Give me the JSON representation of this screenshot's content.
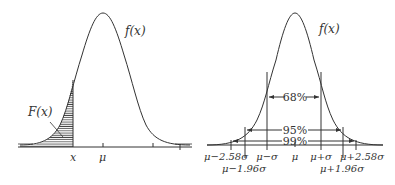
{
  "left_panel": {
    "curve_label": "f(x)",
    "area_label": "F(x)",
    "axis_labels": {
      "x": "x",
      "mu": "μ"
    }
  },
  "right_panel": {
    "curve_label": "f(x)",
    "intervals": [
      {
        "label": "68%",
        "range": "μ±σ"
      },
      {
        "label": "95%",
        "range": "μ±1.96σ"
      },
      {
        "label": "99%",
        "range": "μ±2.58σ"
      }
    ],
    "tick_labels_upper": [
      "μ−2.58σ",
      "μ−σ",
      "μ",
      "μ+σ",
      "μ+2.58σ"
    ],
    "tick_labels_lower": [
      "μ−1.96σ",
      "μ+1.96σ"
    ]
  },
  "colors": {
    "line": "#333333",
    "background": "#ffffff"
  }
}
